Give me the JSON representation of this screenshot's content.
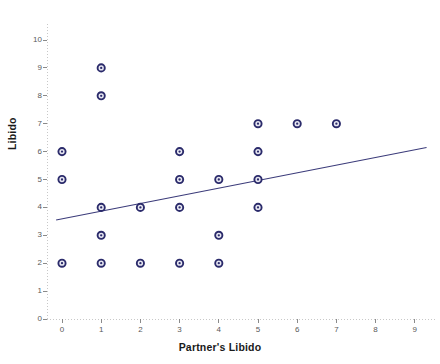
{
  "chart_data": {
    "type": "scatter",
    "title": "",
    "xlabel": "Partner's Libido",
    "ylabel": "Libido",
    "xlim": [
      0,
      9
    ],
    "ylim": [
      0,
      10
    ],
    "xticks": [
      0,
      1,
      2,
      3,
      4,
      5,
      6,
      7,
      8,
      9
    ],
    "yticks": [
      0,
      1,
      2,
      3,
      4,
      5,
      6,
      7,
      8,
      9,
      10
    ],
    "xtick_labels": [
      "0",
      "1",
      "2",
      "3",
      "4",
      "5",
      "6",
      "7",
      "8",
      "9"
    ],
    "ytick_labels": [
      "0",
      "1",
      "2",
      "3",
      "4",
      "5",
      "6",
      "7",
      "8",
      "9",
      "10"
    ],
    "grid": false,
    "legend": false,
    "marker": "circle-open",
    "marker_color": "#2b2b6b",
    "marker_fill": "#e8e8f2",
    "axis_color": "#c8c8c8",
    "axis_style": "dotted",
    "points": [
      {
        "x": 0,
        "y": 6
      },
      {
        "x": 0,
        "y": 5
      },
      {
        "x": 0,
        "y": 2
      },
      {
        "x": 1,
        "y": 9
      },
      {
        "x": 1,
        "y": 8
      },
      {
        "x": 1,
        "y": 4
      },
      {
        "x": 1,
        "y": 3
      },
      {
        "x": 1,
        "y": 2
      },
      {
        "x": 2,
        "y": 4
      },
      {
        "x": 2,
        "y": 2
      },
      {
        "x": 3,
        "y": 6
      },
      {
        "x": 3,
        "y": 5
      },
      {
        "x": 3,
        "y": 4
      },
      {
        "x": 3,
        "y": 2
      },
      {
        "x": 4,
        "y": 5
      },
      {
        "x": 4,
        "y": 3
      },
      {
        "x": 4,
        "y": 2
      },
      {
        "x": 5,
        "y": 7
      },
      {
        "x": 5,
        "y": 6
      },
      {
        "x": 5,
        "y": 5
      },
      {
        "x": 5,
        "y": 4
      },
      {
        "x": 6,
        "y": 7
      },
      {
        "x": 7,
        "y": 7
      }
    ],
    "fit_line": {
      "name": "linear-regression",
      "color": "#3b3b7a",
      "x_start": -0.15,
      "y_start": 3.55,
      "x_end": 9.3,
      "y_end": 6.15
    }
  }
}
